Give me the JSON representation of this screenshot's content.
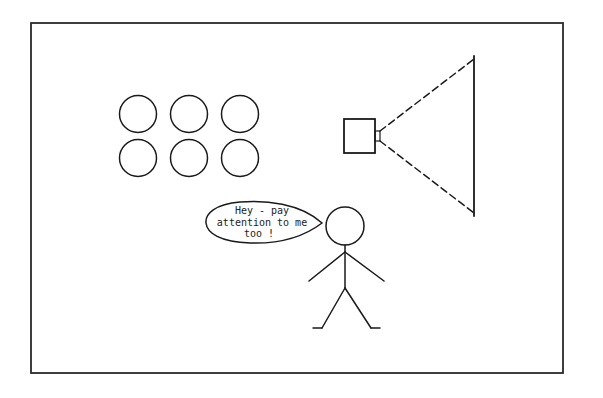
{
  "scene": {
    "title": "Stick figure competing with projector for audience attention",
    "frame": {
      "x": 31,
      "y": 23,
      "width": 532,
      "height": 350
    },
    "audience": {
      "label": "audience-seats",
      "count": 6,
      "radius": 18,
      "positions": [
        {
          "cx": 138,
          "cy": 114
        },
        {
          "cx": 189,
          "cy": 114
        },
        {
          "cx": 240,
          "cy": 114
        },
        {
          "cx": 138,
          "cy": 158
        },
        {
          "cx": 189,
          "cy": 158
        },
        {
          "cx": 240,
          "cy": 158
        }
      ]
    },
    "projector": {
      "body": {
        "x": 344,
        "y": 119,
        "width": 31,
        "height": 34
      },
      "lens": {
        "x": 375,
        "y": 131,
        "width": 5,
        "height": 10
      }
    },
    "projection_screen": {
      "x": 474,
      "y1": 57,
      "y2": 215
    },
    "beam": {
      "upper": {
        "x1": 380,
        "y1": 131,
        "x2": 474,
        "y2": 59
      },
      "lower": {
        "x1": 380,
        "y1": 141,
        "x2": 474,
        "y2": 213
      }
    },
    "stick_figure": {
      "head": {
        "cx": 345,
        "cy": 226,
        "r": 19
      }
    },
    "speech_bubble": {
      "lines": [
        "Hey - pay",
        "attention to me",
        "too !"
      ]
    }
  }
}
